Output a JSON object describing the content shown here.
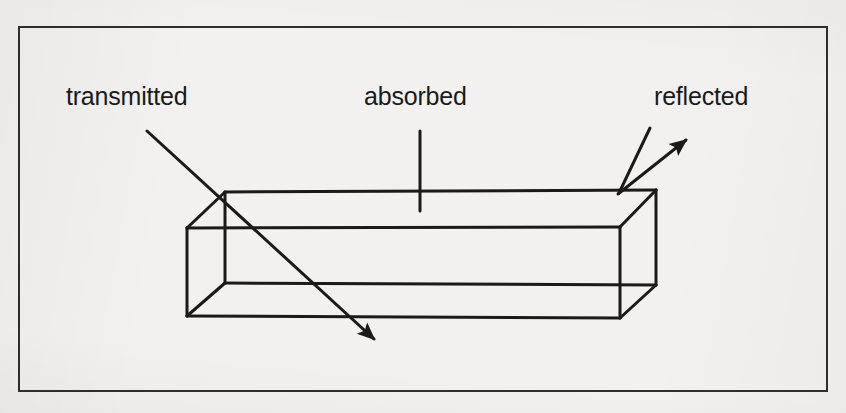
{
  "figure": {
    "kind": "line-diagram",
    "background_color": "#f2f1ef",
    "ink_color": "#1a1a1a",
    "frame": {
      "name": "figure-border",
      "x": 18,
      "y": 26,
      "width": 810,
      "height": 366,
      "stroke": "#2a2a2a",
      "stroke_width": 2
    },
    "labels": [
      {
        "id": "transmitted",
        "text": "transmitted",
        "x": 66,
        "y": 84
      },
      {
        "id": "absorbed",
        "text": "absorbed",
        "x": 364,
        "y": 84
      },
      {
        "id": "reflected",
        "text": "reflected",
        "x": 654,
        "y": 84
      }
    ],
    "box": {
      "name": "rectangular-slab",
      "description": "wireframe rectangular prism seen from above-left, all twelve edges visible",
      "vertices": {
        "back_top_left": [
          225,
          192
        ],
        "back_top_right": [
          656,
          190
        ],
        "front_top_left": [
          187,
          228
        ],
        "front_top_right": [
          620,
          227
        ],
        "back_bottom_left": [
          225,
          283
        ],
        "back_bottom_right": [
          656,
          285
        ],
        "front_bottom_left": [
          187,
          316
        ],
        "front_bottom_right": [
          620,
          318
        ]
      },
      "edges": [
        [
          "back_top_left",
          "back_top_right"
        ],
        [
          "front_top_left",
          "front_top_right"
        ],
        [
          "front_bottom_left",
          "front_bottom_right"
        ],
        [
          "back_bottom_left",
          "back_bottom_right"
        ],
        [
          "back_top_left",
          "front_top_left"
        ],
        [
          "back_top_right",
          "front_top_right"
        ],
        [
          "back_bottom_left",
          "front_bottom_left"
        ],
        [
          "back_bottom_right",
          "front_bottom_right"
        ],
        [
          "back_top_left",
          "back_bottom_left"
        ],
        [
          "back_top_right",
          "back_bottom_right"
        ],
        [
          "front_top_left",
          "front_bottom_left"
        ],
        [
          "front_top_right",
          "front_bottom_right"
        ]
      ],
      "stroke_width": 3
    },
    "rays": [
      {
        "id": "transmitted-ray",
        "name": "transmitted-ray-arrow",
        "from_label": "transmitted",
        "has_arrowhead": true,
        "points": [
          [
            147,
            131
          ],
          [
            376,
            341
          ]
        ],
        "arrow_at": [
          376,
          341
        ],
        "stroke_width": 3
      },
      {
        "id": "absorbed-leader",
        "name": "absorbed-leader-line",
        "from_label": "absorbed",
        "has_arrowhead": false,
        "points": [
          [
            420,
            131
          ],
          [
            420,
            211
          ]
        ],
        "stroke_width": 3
      },
      {
        "id": "reflected-leader",
        "name": "reflected-leader-line",
        "from_label": "reflected",
        "has_arrowhead": false,
        "points": [
          [
            650,
            128
          ],
          [
            619,
            193
          ]
        ],
        "stroke_width": 3
      },
      {
        "id": "reflected-ray",
        "name": "reflected-ray-arrow",
        "from_label": "reflected",
        "has_arrowhead": true,
        "points": [
          [
            618,
            194
          ],
          [
            688,
            138
          ]
        ],
        "arrow_at": [
          688,
          138
        ],
        "stroke_width": 3
      }
    ]
  }
}
